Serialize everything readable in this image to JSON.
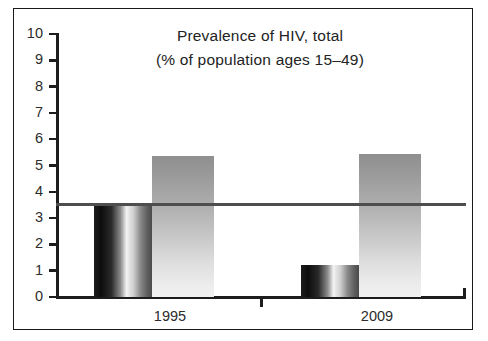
{
  "chart_data": {
    "type": "bar",
    "title": "Prevalence of HIV, total",
    "subtitle": "(% of population ages 15–49)",
    "xlabel": "",
    "ylabel": "",
    "ylim": [
      0,
      10
    ],
    "ytick_labels": [
      "10",
      "9",
      "8",
      "7",
      "6",
      "5",
      "4",
      "3",
      "2",
      "1",
      "0"
    ],
    "ytick_values": [
      10,
      9,
      8,
      7,
      6,
      5,
      4,
      3,
      2,
      1,
      0
    ],
    "categories": [
      "1995",
      "2009"
    ],
    "grid": false,
    "legend": "none",
    "series": [
      {
        "name": "dark-series",
        "style": "dark-gradient",
        "color": "#1c1c1c",
        "values": [
          3.5,
          1.2
        ]
      },
      {
        "name": "light-series",
        "style": "light-gradient",
        "color": "#b5b5b5",
        "values": [
          5.35,
          5.45
        ]
      }
    ],
    "annotations": [
      {
        "type": "horizontal-reference-line",
        "value": 3.5,
        "color": "#4e4e4e"
      }
    ]
  },
  "frame": {
    "border_color": "#1a1a1a",
    "background": "#ffffff"
  },
  "axis": {
    "color": "#1d1d1d"
  }
}
